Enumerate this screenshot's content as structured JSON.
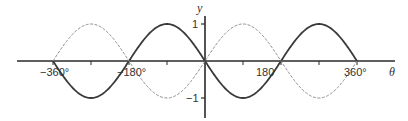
{
  "chart_data": {
    "type": "line",
    "title": "",
    "xlabel": "θ",
    "ylabel": "y",
    "xlim": [
      -360,
      360
    ],
    "ylim": [
      -1,
      1
    ],
    "grid": false,
    "legend": null,
    "x_ticks": [
      -360,
      -270,
      -180,
      -90,
      0,
      90,
      180,
      270,
      360
    ],
    "x_tick_labels": [
      {
        "value": -360,
        "label": "−360°"
      },
      {
        "value": -180,
        "label": "−180°"
      },
      {
        "value": 180,
        "label": "180"
      },
      {
        "value": 360,
        "label": "360°"
      }
    ],
    "y_tick_labels": [
      {
        "value": 1,
        "label": "1"
      },
      {
        "value": -1,
        "label": "−1"
      }
    ],
    "series": [
      {
        "name": "solid curve (y = −sin θ)",
        "style": "solid",
        "color": "#3a3a3a",
        "x": [
          -360,
          -270,
          -180,
          -90,
          0,
          90,
          180,
          270,
          360
        ],
        "values": [
          0,
          -1,
          0,
          1,
          0,
          -1,
          0,
          1,
          0
        ]
      },
      {
        "name": "dashed curve (y = sin θ)",
        "style": "dashed",
        "color": "#7a7a7a",
        "x": [
          -360,
          -270,
          -180,
          -90,
          0,
          90,
          180,
          270,
          360
        ],
        "values": [
          0,
          1,
          0,
          -1,
          0,
          1,
          0,
          -1,
          0
        ]
      }
    ]
  },
  "labels": {
    "y_axis": "y",
    "x_axis": "θ",
    "y_pos": "1",
    "y_neg": "−1",
    "x_neg360": "−360°",
    "x_neg180": "−180°",
    "x_180": "180",
    "x_360": "360°"
  }
}
